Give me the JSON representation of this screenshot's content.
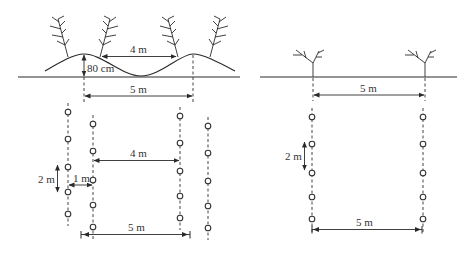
{
  "diagram": {
    "colors": {
      "line": "#2a2a2a",
      "text": "#333333",
      "background": "#ffffff"
    },
    "left_panel": {
      "title": "Ridge planting (raised bed)",
      "profile": {
        "ridge_height_label": "80 cm",
        "row_spacing_on_ridge_label": "4 m",
        "ridge_center_spacing_label": "5 m"
      },
      "plan": {
        "inner_row_spacing_label": "4 m",
        "in_row_spacing_label": "2 m",
        "stagger_offset_label": "1 m",
        "ridge_spacing_label": "5 m"
      }
    },
    "right_panel": {
      "title": "Flat planting",
      "profile": {
        "row_spacing_label": "5 m"
      },
      "plan": {
        "in_row_spacing_label": "2 m",
        "row_spacing_label": "5 m"
      }
    }
  }
}
